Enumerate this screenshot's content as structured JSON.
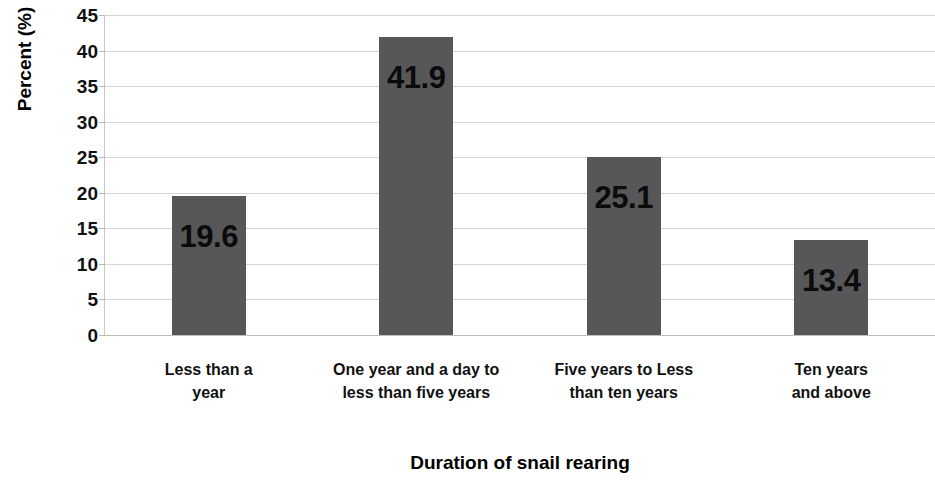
{
  "chart_data": {
    "type": "bar",
    "title": "",
    "xlabel": "Duration of snail rearing",
    "ylabel": "Percent (%)",
    "categories": [
      "Less than a year",
      "One year and a day to less than five years",
      "Five years to Less than ten years",
      "Ten years and above"
    ],
    "category_lines": [
      [
        "Less than a",
        "year"
      ],
      [
        "One year and a day to",
        "less than five years"
      ],
      [
        "Five years to Less",
        "than ten years"
      ],
      [
        "Ten years",
        "and above"
      ]
    ],
    "values": [
      19.6,
      41.9,
      25.1,
      13.4
    ],
    "value_labels": [
      "19.6",
      "41.9",
      "25.1",
      "13.4"
    ],
    "ylim": [
      0,
      45
    ],
    "ytick_step": 5,
    "ytick_labels": [
      "45",
      "40",
      "35",
      "30",
      "25",
      "20",
      "15",
      "10",
      "5",
      "0"
    ],
    "grid": true,
    "grid_axis": "y",
    "legend": false,
    "legend_position": "none",
    "colors": {
      "bar": "#575759",
      "gridline": "#d4d4d4",
      "axis": "#c9c9c9",
      "text": "#111111",
      "background": "#ffffff"
    }
  }
}
